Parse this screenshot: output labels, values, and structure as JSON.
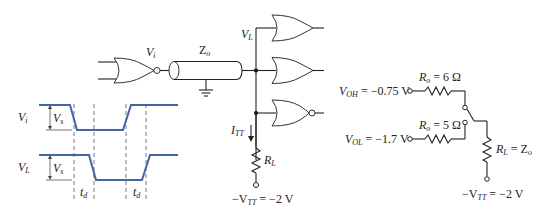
{
  "circuit": {
    "driver_output_label": "V",
    "driver_output_sub": "i",
    "line_impedance_label": "Z",
    "line_impedance_sub": "o",
    "load_voltage_label": "V",
    "load_voltage_sub": "L",
    "termination_current_label": "I",
    "termination_current_sub": "TT",
    "termination_resistor_label": "R",
    "termination_resistor_sub": "L",
    "termination_supply_pre": "−V",
    "termination_supply_sub": "TT",
    "termination_supply_post": " = −2 V",
    "receivers": [
      "or-gate",
      "or-gate",
      "nor-gate"
    ]
  },
  "waveforms": {
    "input_label": "V",
    "input_sub": "i",
    "load_label": "V",
    "load_sub": "L",
    "swing_label": "V",
    "swing_sub": "s",
    "delay_label_1": "t",
    "delay_label_2": "t",
    "delay_sub": "d",
    "color": "#3f66a5"
  },
  "equivalent": {
    "voh_label": "V",
    "voh_sub": "OH",
    "voh_value": " = −0.75 V",
    "vol_label": "V",
    "vol_sub": "OL",
    "vol_value": " = −1.7 V",
    "ro_high_label": "R",
    "ro_high_sub": "o",
    "ro_high_value": " = 6 Ω",
    "ro_low_label": "R",
    "ro_low_sub": "o",
    "ro_low_value": " = 5 Ω",
    "rl_label": "R",
    "rl_sub": "L",
    "rl_eq": " = Z",
    "rl_eq_sub": "o",
    "vtt_pre": "−V",
    "vtt_sub": "TT",
    "vtt_value": " = −2 V"
  }
}
